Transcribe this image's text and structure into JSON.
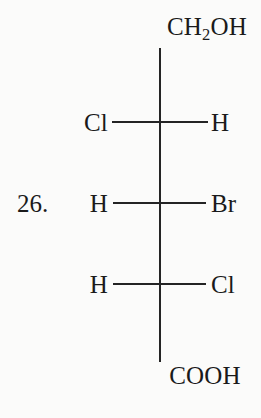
{
  "figure": {
    "question_number": "26.",
    "molecule": {
      "type": "fischer-projection",
      "top_group": {
        "formula": "CH2OH",
        "display_prefix": "CH",
        "display_subscript": "2",
        "display_suffix": "OH"
      },
      "bottom_group": {
        "formula": "COOH",
        "display": "COOH"
      },
      "stereocenters": [
        {
          "index": 1,
          "left": "Cl",
          "right": "H"
        },
        {
          "index": 2,
          "left": "H",
          "right": "Br"
        },
        {
          "index": 3,
          "left": "H",
          "right": "Cl"
        }
      ]
    }
  },
  "colors": {
    "background": "#fbfbfa",
    "ink": "#1a1a1a",
    "bond": "#242424"
  }
}
